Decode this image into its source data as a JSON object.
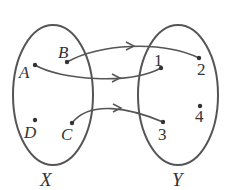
{
  "diagram": {
    "type": "mapping",
    "colors": {
      "stroke": "#555555",
      "text": "#333333"
    },
    "sets": [
      {
        "name": "X",
        "elements": [
          "A",
          "B",
          "C",
          "D"
        ]
      },
      {
        "name": "Y",
        "elements": [
          "1",
          "2",
          "3",
          "4"
        ]
      }
    ],
    "labels": {
      "X": "X",
      "Y": "Y",
      "A": "A",
      "B": "B",
      "C": "C",
      "D": "D",
      "n1": "1",
      "n2": "2",
      "n3": "3",
      "n4": "4"
    },
    "mappings": [
      {
        "from": "B",
        "to": "2"
      },
      {
        "from": "A",
        "to": "1"
      },
      {
        "from": "C",
        "to": "3"
      }
    ]
  }
}
